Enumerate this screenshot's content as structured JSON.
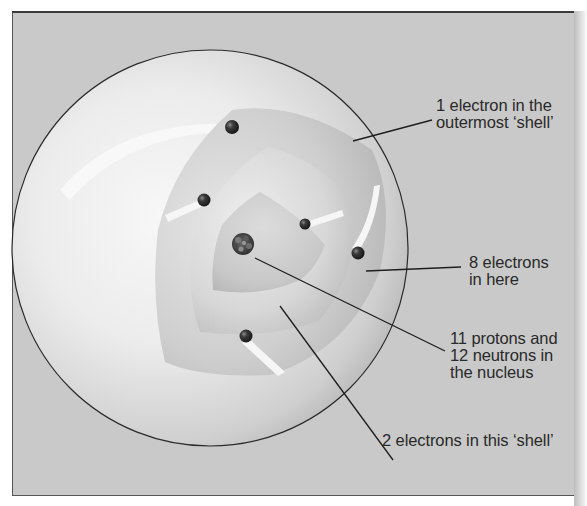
{
  "diagram": {
    "colors": {
      "background": "#c9c9c9",
      "frame_border": "#3a3a3a",
      "sphere_light": "#f4f4f4",
      "sphere_dark": "#a8a8a8",
      "electron": "#2e2e2e",
      "leader_line": "#1e1e1e",
      "label_text": "#2a2a2a"
    },
    "labels": [
      {
        "id": "outer-shell",
        "text": "1 electron in the\noutermost ‘shell’"
      },
      {
        "id": "middle-shell",
        "text": "8 electrons\nin here"
      },
      {
        "id": "nucleus",
        "text": "11 protons and\n12 neutrons in\nthe nucleus"
      },
      {
        "id": "inner-shell",
        "text": "2 electrons in this ‘shell’"
      }
    ],
    "counts": {
      "outer_shell_electrons": 1,
      "middle_shell_electrons": 8,
      "inner_shell_electrons": 2,
      "protons": 11,
      "neutrons": 12
    }
  }
}
